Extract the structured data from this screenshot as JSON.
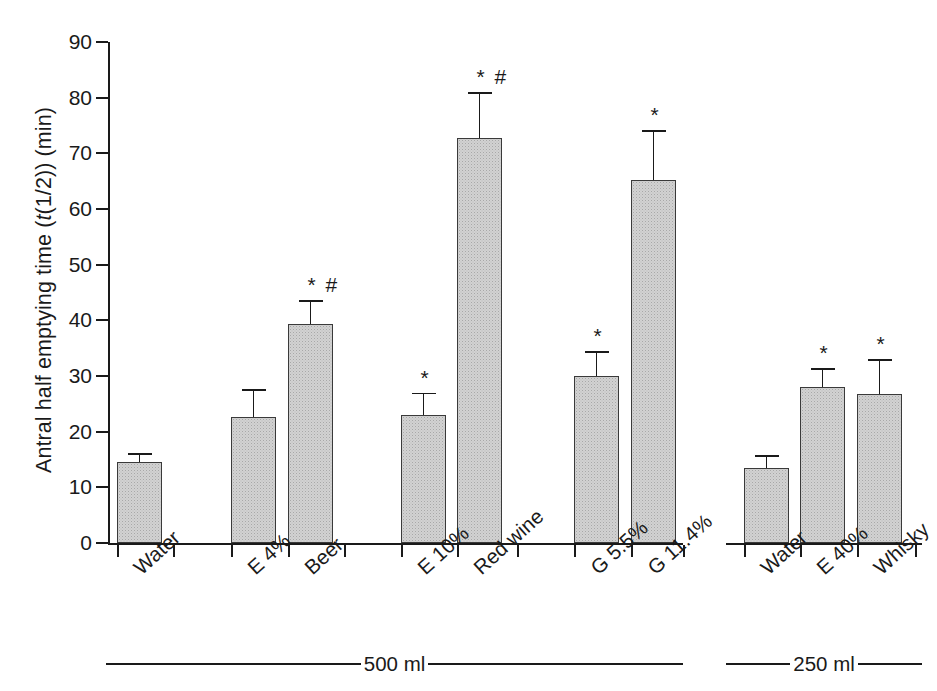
{
  "chart_data": {
    "type": "bar",
    "title": "",
    "xlabel": "",
    "ylabel": "Antral half emptying time (t(1/2)) (min)",
    "ylabel_parts": {
      "pre": "Antral half emptying time (",
      "italic": "t",
      "post": "(1/2)) (min)"
    },
    "ylim": [
      0,
      90
    ],
    "yticks": [
      0,
      10,
      20,
      30,
      40,
      50,
      60,
      70,
      80,
      90
    ],
    "ytick_labels": [
      "0",
      "10",
      "20",
      "30",
      "40",
      "50",
      "60",
      "70",
      "80",
      "90"
    ],
    "grid": false,
    "legend": "none",
    "categories": [
      "Water",
      "E 4%",
      "Beer",
      "E 10%",
      "Red wine",
      "G 5.5%",
      "G 11.4%",
      "Water",
      "E 40%",
      "Whisky"
    ],
    "values": [
      14.6,
      22.6,
      39.3,
      23.0,
      72.8,
      30.0,
      65.2,
      13.4,
      28.1,
      26.7
    ],
    "errors": [
      1.6,
      5.0,
      4.3,
      4.0,
      8.2,
      4.5,
      9.0,
      2.4,
      3.3,
      6.3
    ],
    "error_tops": [
      16.2,
      27.6,
      43.6,
      27.0,
      81.0,
      34.5,
      74.2,
      15.8,
      31.4,
      33.0
    ],
    "significance": [
      "",
      "",
      "* #",
      "*",
      "* #",
      "*",
      "*",
      "",
      "*",
      "*"
    ],
    "groups": [
      {
        "label": "500 ml",
        "categories": [
          "Water",
          "E 4%",
          "Beer",
          "E 10%",
          "Red wine",
          "G 5.5%",
          "G 11.4%"
        ]
      },
      {
        "label": "250 ml",
        "categories": [
          "Water",
          "E 40%",
          "Whisky"
        ]
      }
    ],
    "bar_fill_color": "#d2d2d2",
    "bar_edge_color": "#3a3a3a",
    "axis_color": "#1a1a1a",
    "background_color": "#ffffff",
    "significance_notes": {
      "asterisk": "*",
      "hash": "#"
    }
  },
  "bars": [
    {
      "label": "Water",
      "value": 14.6,
      "error_top": 16.2,
      "sig": "",
      "x": 117,
      "w": 45
    },
    {
      "label": "E 4%",
      "value": 22.6,
      "error_top": 27.6,
      "sig": "",
      "x": 231,
      "w": 45
    },
    {
      "label": "Beer",
      "value": 39.3,
      "error_top": 43.6,
      "sig": "* #",
      "x": 288,
      "w": 45
    },
    {
      "label": "E 10%",
      "value": 23.0,
      "error_top": 27.0,
      "sig": "*",
      "x": 401,
      "w": 45
    },
    {
      "label": "Red wine",
      "value": 72.8,
      "error_top": 81.0,
      "sig": "* #",
      "x": 457,
      "w": 45
    },
    {
      "label": "G 5.5%",
      "value": 30.0,
      "error_top": 34.5,
      "sig": "*",
      "x": 574,
      "w": 45
    },
    {
      "label": "G 11.4%",
      "value": 65.2,
      "error_top": 74.2,
      "sig": "*",
      "x": 631,
      "w": 45
    },
    {
      "label": "Water",
      "value": 13.4,
      "error_top": 15.8,
      "sig": "",
      "x": 744,
      "w": 45
    },
    {
      "label": "E 40%",
      "value": 28.1,
      "error_top": 31.4,
      "sig": "*",
      "x": 800,
      "w": 45
    },
    {
      "label": "Whisky",
      "value": 26.7,
      "error_top": 33.0,
      "sig": "*",
      "x": 857,
      "w": 45
    }
  ],
  "xticks": [
    117,
    173,
    231,
    288,
    344,
    401,
    457,
    517,
    574,
    631,
    683,
    744,
    800,
    857,
    915
  ],
  "groups": {
    "left": "500 ml",
    "right": "250 ml"
  }
}
